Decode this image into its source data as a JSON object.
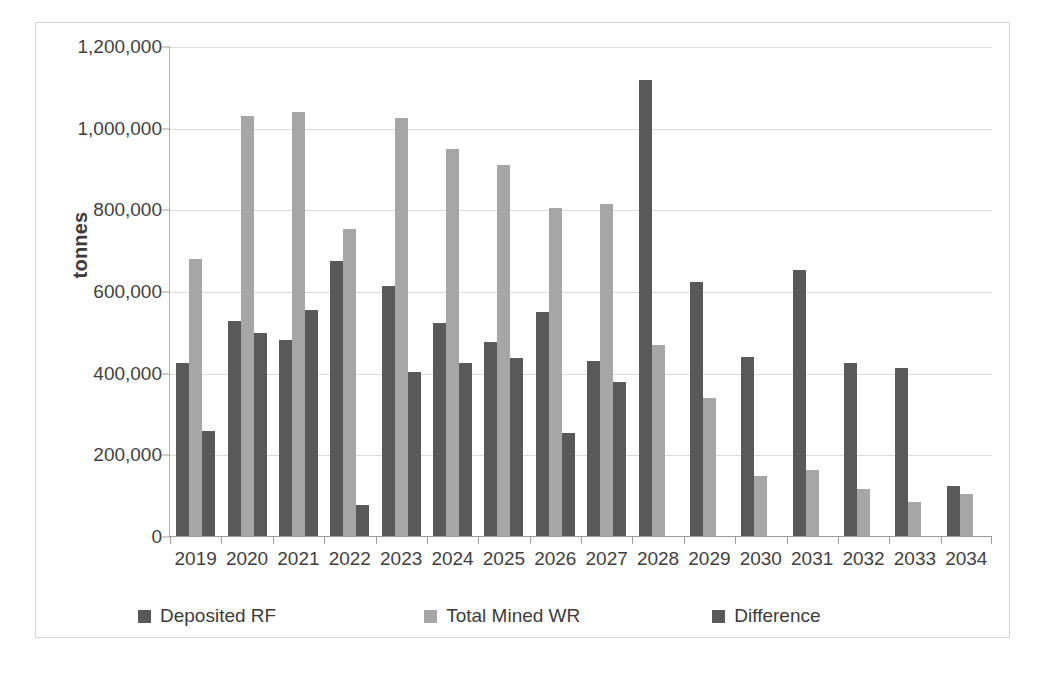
{
  "chart_data": {
    "type": "bar",
    "title": "",
    "xlabel": "",
    "ylabel": "tonnes",
    "ylim": [
      0,
      1200000
    ],
    "yticks": [
      0,
      200000,
      400000,
      600000,
      800000,
      1000000,
      1200000
    ],
    "ytick_labels": [
      "0",
      "200,000",
      "400,000",
      "600,000",
      "800,000",
      "1,000,000",
      "1,200,000"
    ],
    "grid": true,
    "legend_position": "bottom",
    "categories": [
      "2019",
      "2020",
      "2021",
      "2022",
      "2023",
      "2024",
      "2025",
      "2026",
      "2027",
      "2028",
      "2029",
      "2030",
      "2031",
      "2032",
      "2033",
      "2034"
    ],
    "series": [
      {
        "name": "Deposited RF",
        "color": "#595959",
        "values": [
          425000,
          530000,
          483000,
          675000,
          615000,
          525000,
          478000,
          550000,
          432000,
          1120000,
          625000,
          440000,
          655000,
          425000,
          415000,
          125000
        ]
      },
      {
        "name": "Total Mined WR",
        "color": "#a6a6a6",
        "values": [
          680000,
          1030000,
          1040000,
          755000,
          1025000,
          950000,
          910000,
          805000,
          815000,
          470000,
          340000,
          150000,
          165000,
          118000,
          85000,
          105000
        ]
      },
      {
        "name": "Difference",
        "color": "#595959",
        "values": [
          260000,
          500000,
          557000,
          78000,
          405000,
          425000,
          438000,
          255000,
          380000,
          null,
          null,
          null,
          null,
          null,
          null,
          null
        ]
      }
    ]
  },
  "axis": {
    "y_title": "tonnes"
  },
  "legend": {
    "items": [
      {
        "label": "Deposited RF",
        "color": "#595959"
      },
      {
        "label": "Total Mined WR",
        "color": "#a6a6a6"
      },
      {
        "label": "Difference",
        "color": "#595959"
      }
    ]
  },
  "colors": {
    "series_dark": "#595959",
    "series_light": "#a6a6a6",
    "gridline": "#d9d9d9",
    "frame": "#d4d4d4",
    "text": "#3f3f3f"
  }
}
